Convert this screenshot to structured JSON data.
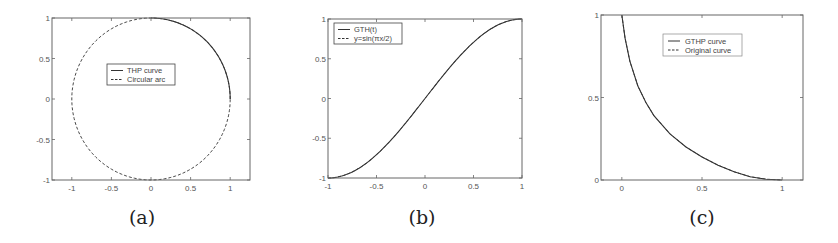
{
  "chart_data": [
    {
      "id": "a",
      "type": "line",
      "caption": "(a)",
      "xlim": [
        -1.25,
        1.25
      ],
      "ylim": [
        -1,
        1
      ],
      "xticks": [
        -1,
        -0.5,
        0,
        0.5,
        1
      ],
      "xtick_labels": [
        "-1",
        "-0.5",
        "0",
        "0.5",
        "1"
      ],
      "yticks": [
        -1,
        -0.5,
        0,
        0.5,
        1
      ],
      "ytick_labels": [
        "-1",
        "-0.5",
        "0",
        "0.5",
        "1"
      ],
      "grid": false,
      "legend_position": "center",
      "series": [
        {
          "name": "THP curve",
          "style": "solid",
          "shape": "quarter arc from (0,1) to (1,0)",
          "param": "circle",
          "t_range_deg": [
            0,
            90
          ]
        },
        {
          "name": "Circular arc",
          "style": "dashed",
          "shape": "unit circle",
          "param": "circle",
          "t_range_deg": [
            0,
            360
          ]
        }
      ]
    },
    {
      "id": "b",
      "type": "line",
      "caption": "(b)",
      "xlim": [
        -1,
        1
      ],
      "ylim": [
        -1,
        1
      ],
      "xticks": [
        -1,
        -0.5,
        0,
        0.5,
        1
      ],
      "xtick_labels": [
        "-1",
        "-0.5",
        "0",
        "0.5",
        "1"
      ],
      "yticks": [
        -1,
        -0.5,
        0,
        0.5,
        1
      ],
      "ytick_labels": [
        "-1",
        "-0.5",
        "0",
        "0.5",
        "1"
      ],
      "grid": false,
      "legend_position": "top-left",
      "series": [
        {
          "name": "GTH(t)",
          "style": "solid",
          "param": "sin"
        },
        {
          "name": "y=sin(πx/2)",
          "style": "dashed",
          "param": "sin"
        }
      ]
    },
    {
      "id": "c",
      "type": "line",
      "caption": "(c)",
      "xlim": [
        -0.13,
        1.13
      ],
      "ylim": [
        0,
        1
      ],
      "xticks": [
        0,
        0.5,
        1
      ],
      "xtick_labels": [
        "0",
        "0.5",
        "1"
      ],
      "yticks": [
        0,
        0.5,
        1
      ],
      "ytick_labels": [
        "0",
        "0.5",
        "1"
      ],
      "grid": false,
      "legend_position": "top-center",
      "series": [
        {
          "name": "GTHP curve",
          "style": "solid",
          "param": "concave",
          "x": [
            0,
            0.02,
            0.05,
            0.1,
            0.15,
            0.2,
            0.3,
            0.4,
            0.5,
            0.6,
            0.7,
            0.8,
            0.9,
            1.0
          ],
          "y": [
            1.0,
            0.86,
            0.72,
            0.57,
            0.47,
            0.39,
            0.28,
            0.2,
            0.14,
            0.09,
            0.05,
            0.02,
            0.005,
            0.0
          ]
        },
        {
          "name": "Original curve",
          "style": "dashed",
          "param": "concave",
          "x": [
            0,
            0.02,
            0.05,
            0.1,
            0.15,
            0.2,
            0.3,
            0.4,
            0.5,
            0.6,
            0.7,
            0.8,
            0.9,
            1.0
          ],
          "y": [
            1.0,
            0.86,
            0.72,
            0.57,
            0.47,
            0.39,
            0.28,
            0.2,
            0.14,
            0.09,
            0.05,
            0.02,
            0.005,
            0.0
          ]
        }
      ]
    }
  ]
}
